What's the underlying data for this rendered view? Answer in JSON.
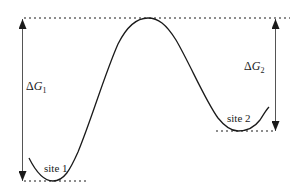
{
  "diagram": {
    "type": "free-energy-profile",
    "labels": {
      "dg1_delta": "Δ",
      "dg1_var": "G",
      "dg1_sub": "1",
      "dg2_delta": "Δ",
      "dg2_var": "G",
      "dg2_sub": "2",
      "site1": "site 1",
      "site2": "site 2"
    },
    "levels": {
      "barrier_top": "top dotted line (peak energy)",
      "site1_min": "bottom dotted line (site 1 minimum)",
      "site2_min": "dotted line (site 2 minimum)"
    },
    "arrows": [
      {
        "name": "ΔG1",
        "from": "site 1 minimum",
        "to": "barrier top",
        "double_headed": true
      },
      {
        "name": "ΔG2",
        "from": "site 2 minimum",
        "to": "barrier top",
        "double_headed": true
      }
    ],
    "colors": {
      "line": "#1a1a1a",
      "background": "#ffffff"
    }
  }
}
